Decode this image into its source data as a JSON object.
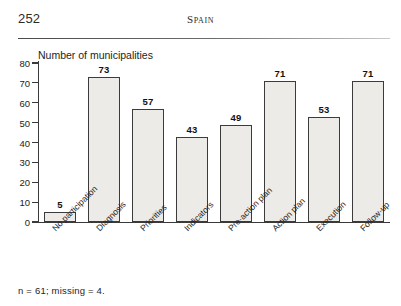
{
  "header": {
    "page_number": "252",
    "running_head": "Spain"
  },
  "figure": {
    "footnote": "n = 61; missing = 4."
  },
  "chart_data": {
    "type": "bar",
    "title": "Number of municipalities",
    "xlabel": "",
    "ylabel": "Number of municipalities",
    "ylim": [
      0,
      80
    ],
    "yticks": [
      0,
      10,
      20,
      30,
      40,
      50,
      60,
      70,
      80
    ],
    "ytick_labels": [
      "0",
      "10",
      "20",
      "30",
      "40",
      "50",
      "60",
      "70",
      "80"
    ],
    "grid": false,
    "legend": "none",
    "categories": [
      "No participation",
      "Diagnosis",
      "Priorities",
      "Indicators",
      "Pre-action plan",
      "Action plan",
      "Execution",
      "Follow-up"
    ],
    "values": [
      5,
      73,
      57,
      43,
      49,
      71,
      53,
      71
    ],
    "value_labels": [
      "5",
      "73",
      "57",
      "43",
      "49",
      "71",
      "53",
      "71"
    ],
    "bar_fill": "#ecebe8",
    "bar_edge": "#3b3b3b"
  }
}
